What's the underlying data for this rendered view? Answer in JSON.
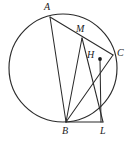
{
  "figure": {
    "background_color": "#ffffff",
    "stroke_color": "#2b2b2b",
    "label_color": "#1a1a1a",
    "width": 135,
    "height": 143
  },
  "circle": {
    "name": "main-circle",
    "cx": 63,
    "cy": 68,
    "r": 54
  },
  "points": [
    {
      "id": "A",
      "label": "A",
      "x": 50,
      "y": 17,
      "label_x": 44,
      "label_y": 2,
      "dot": false
    },
    {
      "id": "M",
      "label": "M",
      "x": 82,
      "y": 38,
      "label_x": 76,
      "label_y": 24,
      "dot": false
    },
    {
      "id": "C",
      "label": "C",
      "x": 113,
      "y": 55,
      "label_x": 117,
      "label_y": 48,
      "dot": false
    },
    {
      "id": "H",
      "label": "H",
      "x": 100,
      "y": 59,
      "label_x": 87,
      "label_y": 50,
      "dot": true
    },
    {
      "id": "B",
      "label": "B",
      "x": 66,
      "y": 122,
      "label_x": 62,
      "label_y": 126,
      "dot": false
    },
    {
      "id": "L",
      "label": "L",
      "x": 103,
      "y": 122,
      "label_x": 100,
      "label_y": 126,
      "dot": false
    }
  ],
  "segments": [
    {
      "id": "AC",
      "from": "A",
      "to": "C",
      "x1": 50,
      "y1": 17,
      "x2": 113,
      "y2": 55
    },
    {
      "id": "AB",
      "from": "A",
      "to": "B",
      "x1": 50,
      "y1": 17,
      "x2": 66,
      "y2": 122
    },
    {
      "id": "MB",
      "from": "M",
      "to": "B",
      "x1": 82,
      "y1": 38,
      "x2": 66,
      "y2": 122
    },
    {
      "id": "ML",
      "from": "M",
      "to": "L",
      "x1": 82,
      "y1": 38,
      "x2": 103,
      "y2": 122
    },
    {
      "id": "BC",
      "from": "B",
      "to": "C",
      "x1": 66,
      "y1": 122,
      "x2": 113,
      "y2": 55
    },
    {
      "id": "BL",
      "from": "B",
      "to": "L",
      "x1": 66,
      "y1": 122,
      "x2": 103,
      "y2": 122
    },
    {
      "id": "HL",
      "from": "H",
      "to": "L",
      "x1": 100,
      "y1": 59,
      "x2": 101,
      "y2": 122
    }
  ]
}
